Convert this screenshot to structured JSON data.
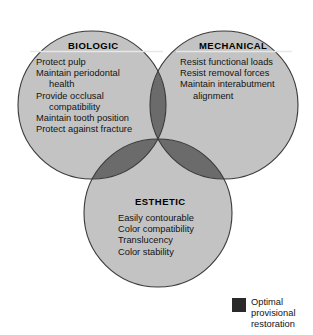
{
  "figure": {
    "type": "venn",
    "background_color": "#ffffff"
  },
  "colors": {
    "single_fill": "#c3c3c3",
    "double_overlap": "#6b6b6b",
    "triple_overlap": "#2a2a2a",
    "outline": "#3a3a3a",
    "title_underline": "#e8e8e8",
    "text": "#131313"
  },
  "sets": [
    {
      "id": "biologic",
      "title": "BIOLOGIC",
      "items": [
        {
          "text": "Protect pulp",
          "continuation": false
        },
        {
          "text": "Maintain periodontal",
          "continuation": false
        },
        {
          "text": "health",
          "continuation": true
        },
        {
          "text": "Provide occlusal",
          "continuation": false
        },
        {
          "text": "compatibility",
          "continuation": true
        },
        {
          "text": "Maintain tooth position",
          "continuation": false
        },
        {
          "text": "Protect against fracture",
          "continuation": false
        }
      ],
      "circle": {
        "cx": 92,
        "cy": 105,
        "r": 74
      }
    },
    {
      "id": "mechanical",
      "title": "MECHANICAL",
      "items": [
        {
          "text": "Resist functional loads",
          "continuation": false
        },
        {
          "text": "Resist removal forces",
          "continuation": false
        },
        {
          "text": "Maintain interabutment",
          "continuation": false
        },
        {
          "text": "alignment",
          "continuation": true
        }
      ],
      "circle": {
        "cx": 224,
        "cy": 105,
        "r": 74
      }
    },
    {
      "id": "esthetic",
      "title": "ESTHETIC",
      "items": [
        {
          "text": "Easily contourable",
          "continuation": false
        },
        {
          "text": "Color compatibility",
          "continuation": false
        },
        {
          "text": "Translucency",
          "continuation": false
        },
        {
          "text": "Color stability",
          "continuation": false
        }
      ],
      "circle": {
        "cx": 158,
        "cy": 213,
        "r": 74
      }
    }
  ],
  "legend": {
    "swatch_color": "#2a2a2a",
    "lines": [
      "Optimal",
      "provisional",
      "restoration"
    ],
    "line1": "Optimal",
    "line2": "provisional",
    "line3": "restoration"
  }
}
